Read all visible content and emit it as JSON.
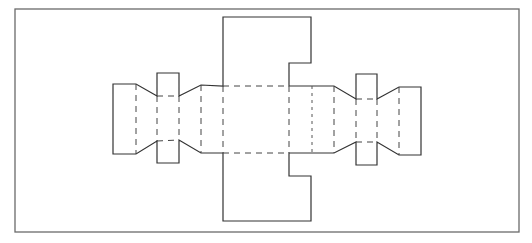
{
  "diagram": {
    "title": "",
    "colors": {
      "line": "#333333",
      "frame": "#6a6a6a",
      "background": "#ffffff"
    },
    "frame": {
      "x": 15,
      "y": 9,
      "width": 504,
      "height": 223
    },
    "legend": {
      "solid": "cut line",
      "dashed": "fold line"
    },
    "parts": [
      {
        "name": "top-flap",
        "type": "cut"
      },
      {
        "name": "bottom-flap",
        "type": "cut"
      },
      {
        "name": "center-panel",
        "type": "fold-bounded"
      },
      {
        "name": "left-tapered-tab",
        "type": "cut"
      },
      {
        "name": "right-tapered-tab",
        "type": "cut"
      }
    ]
  }
}
